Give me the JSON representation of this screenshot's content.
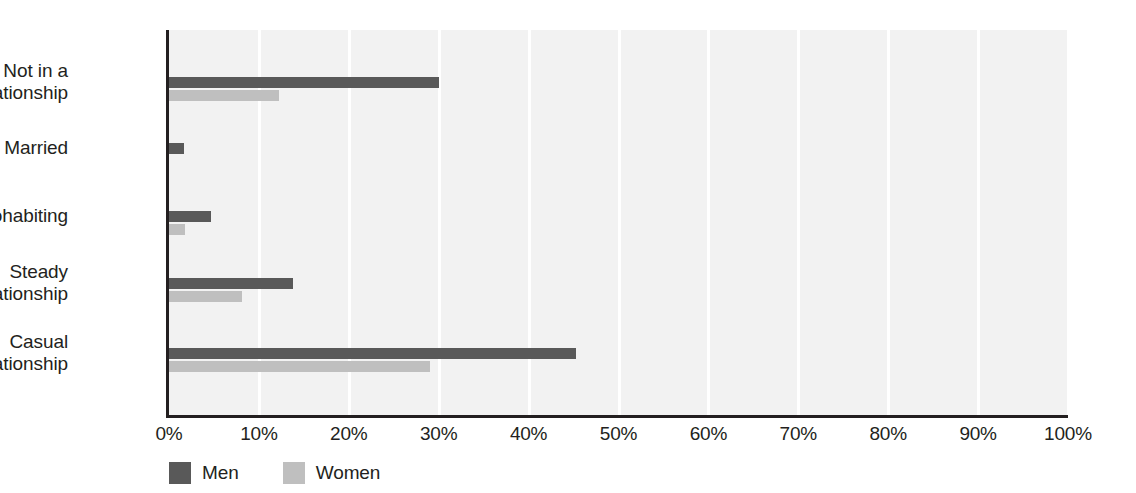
{
  "chart_data": {
    "type": "bar",
    "orientation": "horizontal",
    "title": "",
    "subtitle": "",
    "xlabel": "",
    "ylabel": "",
    "xlim": [
      0,
      100
    ],
    "xtick_labels": [
      "0%",
      "10%",
      "20%",
      "30%",
      "40%",
      "50%",
      "60%",
      "70%",
      "80%",
      "90%",
      "100%"
    ],
    "xtick_values": [
      0,
      10,
      20,
      30,
      40,
      50,
      60,
      70,
      80,
      90,
      100
    ],
    "grid": "vertical",
    "legend_position": "bottom-left",
    "categories": [
      "Not in a\nrelationship",
      "Married",
      "Cohabiting",
      "Steady\nrelationship",
      "Casual\nrelationship"
    ],
    "series": [
      {
        "name": "Men",
        "color": "#595959",
        "values": [
          30,
          1.7,
          4.7,
          13.8,
          45.3
        ]
      },
      {
        "name": "Women",
        "color": "#bfbfbf",
        "values": [
          12.2,
          0,
          1.8,
          8.1,
          29
        ]
      }
    ],
    "colors": {
      "plot_background": "#f2f2f2",
      "gridline": "#ffffff",
      "axis": "#231f20",
      "text": "#231f20",
      "men": "#595959",
      "women": "#bfbfbf"
    }
  }
}
